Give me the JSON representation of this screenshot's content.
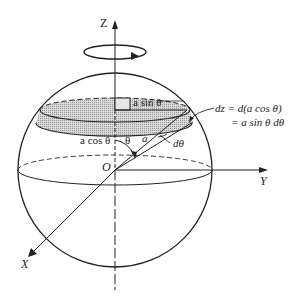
{
  "diagram": {
    "axes": {
      "z": "Z",
      "y": "Y",
      "x": "X",
      "origin": "O"
    },
    "labels": {
      "radius_ring": "a sin θ",
      "height": "a cos θ",
      "theta": "θ",
      "radius": "a",
      "dtheta": "dθ",
      "dz_line1": "dz  =  d(a cos θ)",
      "dz_line2": "=  a sin θ  dθ"
    },
    "colors": {
      "stroke": "#222222",
      "shade": "#c8c8c8",
      "background": "#ffffff"
    }
  }
}
